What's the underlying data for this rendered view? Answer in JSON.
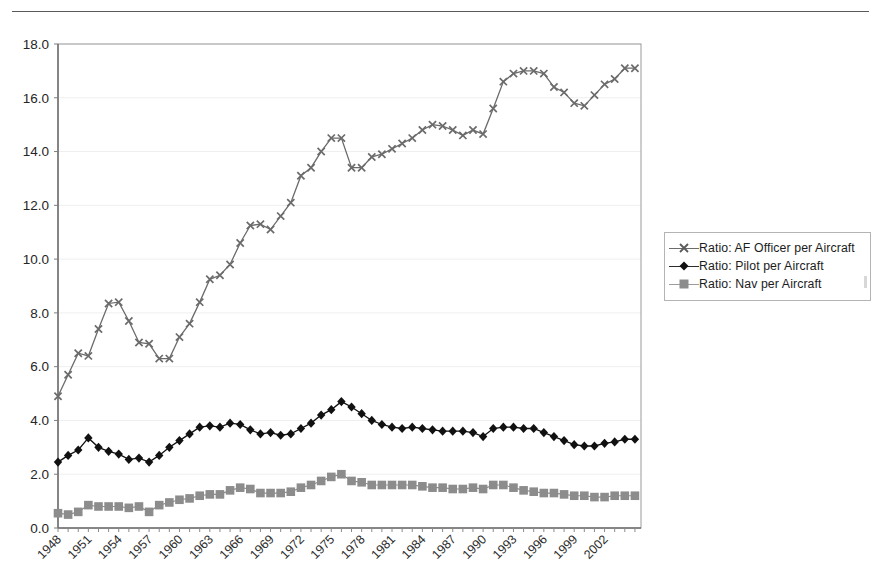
{
  "page": {
    "header_text": "",
    "header_rule": true
  },
  "legend": {
    "position": "right",
    "items": [
      {
        "label": "Ratio:  AF Officer per Aircraft",
        "marker": "x-marker-icon",
        "color": "#6b6b6b"
      },
      {
        "label": "Ratio: Pilot per Aircraft",
        "marker": "diamond-marker-icon",
        "color": "#111111"
      },
      {
        "label": "Ratio: Nav per Aircraft",
        "marker": "square-marker-icon",
        "color": "#8c8c8c"
      }
    ]
  },
  "chart_data": {
    "type": "line",
    "title": "",
    "xlabel": "",
    "ylabel": "",
    "ylim": [
      0.0,
      18.0
    ],
    "ytick_step": 2.0,
    "ytick_labels": [
      "0.0",
      "2.0",
      "4.0",
      "6.0",
      "8.0",
      "10.0",
      "12.0",
      "14.0",
      "16.0",
      "18.0"
    ],
    "grid": true,
    "legend_position": "right",
    "xtick_label_rotation": -45,
    "xtick_label_interval": 3,
    "x": [
      1948,
      1949,
      1950,
      1951,
      1952,
      1953,
      1954,
      1955,
      1956,
      1957,
      1958,
      1959,
      1960,
      1961,
      1962,
      1963,
      1964,
      1965,
      1966,
      1967,
      1968,
      1969,
      1970,
      1971,
      1972,
      1973,
      1974,
      1975,
      1976,
      1977,
      1978,
      1979,
      1980,
      1981,
      1982,
      1983,
      1984,
      1985,
      1986,
      1987,
      1988,
      1989,
      1990,
      1991,
      1992,
      1993,
      1994,
      1995,
      1996,
      1997,
      1998,
      1999,
      2000,
      2001,
      2002,
      2003,
      2004,
      2005
    ],
    "xtick_labels": [
      "1948",
      "1951",
      "1954",
      "1957",
      "1960",
      "1963",
      "1966",
      "1969",
      "1972",
      "1975",
      "1978",
      "1981",
      "1984",
      "1987",
      "1990",
      "1993",
      "1996",
      "1999",
      "2002"
    ],
    "series": [
      {
        "name": "Ratio:  AF Officer per Aircraft",
        "marker": "x",
        "color": "#6b6b6b",
        "values": [
          4.9,
          5.7,
          6.5,
          6.4,
          7.4,
          8.35,
          8.4,
          7.7,
          6.9,
          6.85,
          6.3,
          6.3,
          7.1,
          7.6,
          8.4,
          9.25,
          9.4,
          9.8,
          10.6,
          11.25,
          11.3,
          11.1,
          11.6,
          12.1,
          13.1,
          13.4,
          14.0,
          14.5,
          14.5,
          13.4,
          13.4,
          13.8,
          13.9,
          14.1,
          14.3,
          14.5,
          14.8,
          15.0,
          14.95,
          14.8,
          14.6,
          14.8,
          14.65,
          15.6,
          16.6,
          16.9,
          17.0,
          17.0,
          16.9,
          16.4,
          16.2,
          15.8,
          15.7,
          16.1,
          16.5,
          16.7,
          17.1,
          17.1
        ]
      },
      {
        "name": "Ratio: Pilot per Aircraft",
        "marker": "diamond",
        "color": "#111111",
        "values": [
          2.45,
          2.7,
          2.9,
          3.35,
          3.0,
          2.85,
          2.75,
          2.55,
          2.6,
          2.45,
          2.7,
          3.0,
          3.25,
          3.5,
          3.75,
          3.8,
          3.75,
          3.9,
          3.85,
          3.65,
          3.5,
          3.55,
          3.45,
          3.5,
          3.7,
          3.9,
          4.2,
          4.4,
          4.7,
          4.5,
          4.25,
          4.0,
          3.85,
          3.75,
          3.7,
          3.75,
          3.7,
          3.65,
          3.6,
          3.6,
          3.6,
          3.55,
          3.4,
          3.7,
          3.75,
          3.75,
          3.7,
          3.7,
          3.55,
          3.4,
          3.25,
          3.1,
          3.05,
          3.05,
          3.15,
          3.2,
          3.3,
          3.3
        ]
      },
      {
        "name": "Ratio: Nav per Aircraft",
        "marker": "square",
        "color": "#8c8c8c",
        "values": [
          0.55,
          0.5,
          0.6,
          0.85,
          0.8,
          0.8,
          0.8,
          0.75,
          0.8,
          0.6,
          0.85,
          0.95,
          1.05,
          1.1,
          1.2,
          1.25,
          1.25,
          1.4,
          1.5,
          1.45,
          1.3,
          1.3,
          1.3,
          1.35,
          1.5,
          1.6,
          1.75,
          1.9,
          2.0,
          1.75,
          1.7,
          1.6,
          1.6,
          1.6,
          1.6,
          1.6,
          1.55,
          1.5,
          1.5,
          1.45,
          1.45,
          1.5,
          1.45,
          1.6,
          1.6,
          1.5,
          1.4,
          1.35,
          1.3,
          1.3,
          1.25,
          1.2,
          1.2,
          1.15,
          1.15,
          1.2,
          1.2,
          1.2
        ]
      }
    ]
  }
}
